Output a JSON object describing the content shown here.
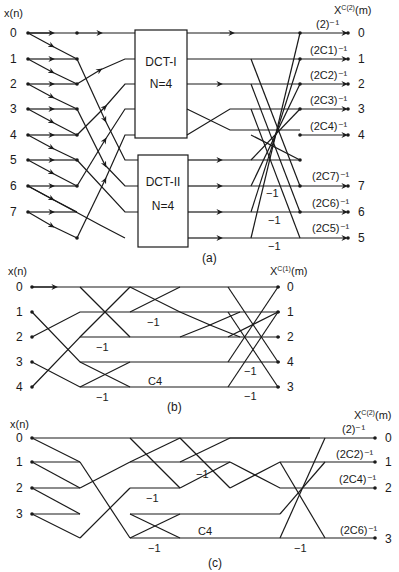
{
  "figure_a": {
    "input_header": "x(n)",
    "output_header_base": "X",
    "output_header_sup": "C(2)",
    "output_header_tail": "(m)",
    "inputs": [
      "0",
      "1",
      "2",
      "3",
      "4",
      "5",
      "6",
      "7"
    ],
    "outputs": [
      "0",
      "1",
      "2",
      "3",
      "4",
      "7",
      "6",
      "5"
    ],
    "coefficients": [
      "(2)⁻¹",
      "(2C1)⁻¹",
      "(2C2)⁻¹",
      "(2C3)⁻¹",
      "(2C4)⁻¹",
      "(2C7)⁻¹",
      "(2C6)⁻¹",
      "(2C5)⁻¹"
    ],
    "block1": {
      "title": "DCT-I",
      "size": "N=4"
    },
    "block2": {
      "title": "DCT-II",
      "size": "N=4"
    },
    "neg_labels": [
      "−1",
      "−1",
      "−1"
    ],
    "caption": "(a)"
  },
  "figure_b": {
    "input_header": "x(n)",
    "output_header_base": "X",
    "output_header_sup": "C(1)",
    "output_header_tail": "(m)",
    "inputs": [
      "0",
      "1",
      "2",
      "3",
      "4"
    ],
    "outputs": [
      "0",
      "1",
      "2",
      "4",
      "3"
    ],
    "neg_labels": [
      "−1",
      "−1",
      "−1",
      "−1",
      "−1"
    ],
    "c4_label": "C4",
    "caption": "(b)"
  },
  "figure_c": {
    "input_header": "x(n)",
    "output_header_base": "X",
    "output_header_sup": "C(2)",
    "output_header_tail": "(m)",
    "inputs": [
      "0",
      "1",
      "2",
      "3"
    ],
    "outputs": [
      "0",
      "1",
      "2",
      "3"
    ],
    "coefficients": [
      "(2)⁻¹",
      "(2C2)⁻¹",
      "(2C4)⁻¹",
      "(2C6)⁻¹"
    ],
    "neg_labels": [
      "−1",
      "−1",
      "−1",
      "−1"
    ],
    "c4_label": "C4",
    "caption": "(c)"
  },
  "colors": {
    "ink": "#1a1a1a",
    "background": "#ffffff"
  }
}
